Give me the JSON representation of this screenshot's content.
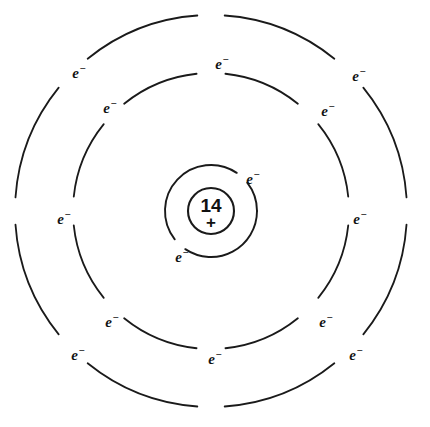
{
  "diagram": {
    "element_symbol_shown": false,
    "background_color": "#ffffff",
    "stroke_color": "#1a1a1a",
    "center": {
      "x": 211,
      "y": 211
    },
    "nucleus": {
      "label": "14",
      "charge": "+",
      "radius": 23,
      "meaning": "nuclear-charge-14-plus"
    },
    "electron_glyph": {
      "symbol": "e",
      "superscript": "−"
    },
    "shells": [
      {
        "name": "shell-1",
        "radius": 46,
        "electron_count": 2,
        "stroke_width": 1.9,
        "arc_gaps_deg": [
          [
            38,
            56
          ],
          [
            218,
            236
          ]
        ],
        "electrons": [
          {
            "id": "s1-e1",
            "angle_deg": 47,
            "label_x": 253,
            "label_y": 179
          },
          {
            "id": "s1-e2",
            "angle_deg": 227,
            "label_x": 182,
            "label_y": 257
          }
        ]
      },
      {
        "name": "shell-2",
        "radius": 138,
        "electron_count": 8,
        "stroke_width": 1.8,
        "arc_gaps_deg": [
          [
            84,
            96
          ],
          [
            39,
            51
          ],
          [
            354,
            6
          ],
          [
            309,
            321
          ],
          [
            264,
            276
          ],
          [
            219,
            231
          ],
          [
            174,
            186
          ],
          [
            129,
            141
          ]
        ],
        "electrons": [
          {
            "id": "s2-e1",
            "angle_deg": 90,
            "label_x": 222,
            "label_y": 64
          },
          {
            "id": "s2-e2",
            "angle_deg": 45,
            "label_x": 328,
            "label_y": 111
          },
          {
            "id": "s2-e3",
            "angle_deg": 0,
            "label_x": 360,
            "label_y": 219
          },
          {
            "id": "s2-e4",
            "angle_deg": 315,
            "label_x": 326,
            "label_y": 322
          },
          {
            "id": "s2-e5",
            "angle_deg": 270,
            "label_x": 215,
            "label_y": 359
          },
          {
            "id": "s2-e6",
            "angle_deg": 225,
            "label_x": 112,
            "label_y": 322
          },
          {
            "id": "s2-e7",
            "angle_deg": 180,
            "label_x": 64,
            "label_y": 219
          },
          {
            "id": "s2-e8",
            "angle_deg": 135,
            "label_x": 110,
            "label_y": 108
          }
        ]
      },
      {
        "name": "shell-3",
        "radius": 196,
        "electron_count": 4,
        "stroke_width": 1.8,
        "arc_gaps_deg": [
          [
            86,
            94
          ],
          [
            129,
            141
          ],
          [
            176,
            184
          ],
          [
            219,
            231
          ],
          [
            266,
            274
          ],
          [
            309,
            321
          ],
          [
            356,
            4
          ],
          [
            39,
            51
          ]
        ],
        "electrons": [
          {
            "id": "s3-e1",
            "angle_deg": 135,
            "label_x": 79,
            "label_y": 73
          },
          {
            "id": "s3-e2",
            "angle_deg": 45,
            "label_x": 359,
            "label_y": 76
          },
          {
            "id": "s3-e3",
            "angle_deg": 315,
            "label_x": 356,
            "label_y": 355
          },
          {
            "id": "s3-e4",
            "angle_deg": 225,
            "label_x": 78,
            "label_y": 355
          }
        ]
      }
    ]
  }
}
